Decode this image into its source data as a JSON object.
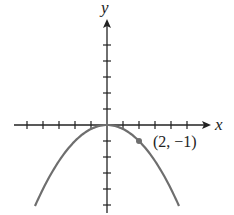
{
  "chart_data": {
    "type": "line",
    "title": "",
    "xlabel": "x",
    "ylabel": "y",
    "function": "y = -x^2/4",
    "xlim": [
      -5.5,
      6.5
    ],
    "ylim": [
      -6.5,
      6.5
    ],
    "x_ticks": [
      -5,
      -4,
      -3,
      -2,
      -1,
      1,
      2,
      3,
      4,
      5
    ],
    "y_ticks": [
      -5,
      -4,
      -3,
      -2,
      -1,
      1,
      2,
      3,
      4,
      5
    ],
    "grid": false,
    "series": [
      {
        "name": "parabola",
        "x": [
          -4.5,
          -4,
          -3,
          -2,
          -1,
          0,
          1,
          2,
          3,
          4,
          4.5
        ],
        "y": [
          -5.06,
          -4,
          -2.25,
          -1,
          -0.25,
          0,
          -0.25,
          -1,
          -2.25,
          -4,
          -5.06
        ],
        "color": "#6b6b6b"
      }
    ],
    "annotations": [
      {
        "x": 2,
        "y": -1,
        "text": "(2, −1)",
        "marker": "dot"
      }
    ]
  },
  "labels": {
    "x_axis": "x",
    "y_axis": "y",
    "point": "(2, −1)"
  }
}
